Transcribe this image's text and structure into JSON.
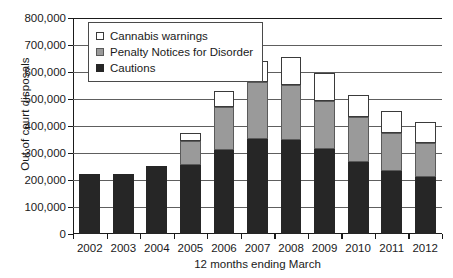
{
  "chart_data": {
    "type": "bar",
    "stacked": true,
    "title": "",
    "xlabel": "12 months ending March",
    "ylabel": "Out of court disposals",
    "categories": [
      "2002",
      "2003",
      "2004",
      "2005",
      "2006",
      "2007",
      "2008",
      "2009",
      "2010",
      "2011",
      "2012"
    ],
    "ylim": [
      0,
      800000
    ],
    "ytick_labels": [
      "0",
      "100,000",
      "200,000",
      "300,000",
      "400,000",
      "500,000",
      "600,000",
      "700,000",
      "800,000"
    ],
    "ytick_values": [
      0,
      100000,
      200000,
      300000,
      400000,
      500000,
      600000,
      700000,
      800000
    ],
    "grid": true,
    "legend_position": "upper-left-inside",
    "series": [
      {
        "name": "Cautions",
        "color": "#262626",
        "values": [
          222000,
          222000,
          252000,
          255000,
          310000,
          352000,
          348000,
          315000,
          268000,
          235000,
          213000
        ]
      },
      {
        "name": "Penalty Notices for Disorder",
        "color": "#9a9a9a",
        "values": [
          0,
          0,
          0,
          90000,
          160000,
          211000,
          204000,
          178000,
          164000,
          138000,
          124000
        ]
      },
      {
        "name": "Cannabis warnings",
        "color": "#ffffff",
        "values": [
          0,
          0,
          0,
          28000,
          60000,
          77000,
          103000,
          102000,
          83000,
          82000,
          78000
        ]
      }
    ],
    "totals": [
      222000,
      222000,
      252000,
      373000,
      530000,
      640000,
      655000,
      595000,
      515000,
      455000,
      415000
    ]
  },
  "legend": {
    "items": [
      {
        "label": "Cannabis warnings",
        "swatch": "cannabis"
      },
      {
        "label": "Penalty Notices for Disorder",
        "swatch": "pnd"
      },
      {
        "label": "Cautions",
        "swatch": "cautions"
      }
    ]
  }
}
